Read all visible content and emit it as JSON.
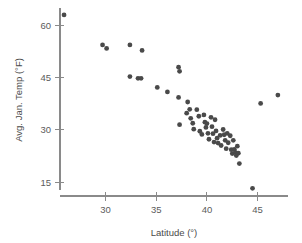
{
  "chart_data": {
    "type": "scatter",
    "title": "",
    "xlabel": "Latitude (°)",
    "ylabel": "Avg. Jan. Temp (°F)",
    "xlim": [
      25.5,
      48.0
    ],
    "ylim": [
      11.0,
      65.0
    ],
    "xticks": [
      30,
      35,
      40,
      45
    ],
    "yticks": [
      15,
      30,
      45,
      60
    ],
    "xtick_labels": [
      "30",
      "35",
      "40",
      "45"
    ],
    "ytick_labels": [
      "15",
      "30",
      "45",
      "60"
    ],
    "grid": false,
    "legend": null,
    "marker_color": "#4a4a4a",
    "marker_size": 2.4,
    "points": [
      {
        "x": 25.9,
        "y": 63.0
      },
      {
        "x": 29.7,
        "y": 54.4
      },
      {
        "x": 30.1,
        "y": 53.4
      },
      {
        "x": 32.4,
        "y": 54.4
      },
      {
        "x": 33.6,
        "y": 52.8
      },
      {
        "x": 32.4,
        "y": 45.3
      },
      {
        "x": 33.2,
        "y": 44.8
      },
      {
        "x": 33.5,
        "y": 44.8
      },
      {
        "x": 35.1,
        "y": 42.2
      },
      {
        "x": 36.1,
        "y": 40.9
      },
      {
        "x": 37.2,
        "y": 48.0
      },
      {
        "x": 37.3,
        "y": 46.8
      },
      {
        "x": 37.2,
        "y": 39.3
      },
      {
        "x": 37.3,
        "y": 31.5
      },
      {
        "x": 38.1,
        "y": 38.0
      },
      {
        "x": 38.0,
        "y": 34.8
      },
      {
        "x": 38.3,
        "y": 35.9
      },
      {
        "x": 38.4,
        "y": 33.3
      },
      {
        "x": 38.6,
        "y": 31.9
      },
      {
        "x": 38.7,
        "y": 30.2
      },
      {
        "x": 39.0,
        "y": 35.8
      },
      {
        "x": 39.2,
        "y": 33.9
      },
      {
        "x": 39.3,
        "y": 29.6
      },
      {
        "x": 39.5,
        "y": 28.7
      },
      {
        "x": 39.7,
        "y": 34.3
      },
      {
        "x": 39.8,
        "y": 32.2
      },
      {
        "x": 39.9,
        "y": 30.7
      },
      {
        "x": 40.0,
        "y": 31.8
      },
      {
        "x": 40.1,
        "y": 29.0
      },
      {
        "x": 40.2,
        "y": 27.3
      },
      {
        "x": 40.4,
        "y": 33.6
      },
      {
        "x": 40.5,
        "y": 30.9
      },
      {
        "x": 40.6,
        "y": 28.9
      },
      {
        "x": 40.7,
        "y": 26.5
      },
      {
        "x": 40.8,
        "y": 32.9
      },
      {
        "x": 40.9,
        "y": 29.7
      },
      {
        "x": 41.0,
        "y": 27.6
      },
      {
        "x": 41.1,
        "y": 26.2
      },
      {
        "x": 41.3,
        "y": 28.4
      },
      {
        "x": 41.4,
        "y": 25.5
      },
      {
        "x": 41.6,
        "y": 30.1
      },
      {
        "x": 41.7,
        "y": 28.6
      },
      {
        "x": 41.8,
        "y": 27.0
      },
      {
        "x": 41.9,
        "y": 24.6
      },
      {
        "x": 42.0,
        "y": 29.0
      },
      {
        "x": 42.1,
        "y": 26.3
      },
      {
        "x": 42.3,
        "y": 28.3
      },
      {
        "x": 42.4,
        "y": 24.3
      },
      {
        "x": 42.5,
        "y": 23.2
      },
      {
        "x": 42.6,
        "y": 27.0
      },
      {
        "x": 42.7,
        "y": 24.4
      },
      {
        "x": 42.8,
        "y": 23.5
      },
      {
        "x": 42.9,
        "y": 22.6
      },
      {
        "x": 43.0,
        "y": 25.3
      },
      {
        "x": 43.1,
        "y": 23.3
      },
      {
        "x": 43.2,
        "y": 20.3
      },
      {
        "x": 44.5,
        "y": 13.2
      },
      {
        "x": 45.3,
        "y": 37.6
      },
      {
        "x": 47.0,
        "y": 40.0
      }
    ]
  },
  "geometry": {
    "plot_left": 60,
    "plot_right": 288,
    "plot_bottom": 196,
    "plot_top": 8,
    "yaxis_x": 60,
    "yaxis_top": 8,
    "yaxis_bottom": 190
  }
}
